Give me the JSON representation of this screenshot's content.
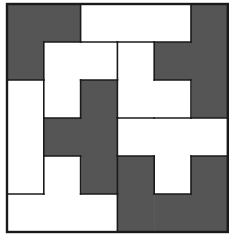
{
  "puzzle": {
    "grid_size": 6,
    "origin": [
      7,
      4
    ],
    "cell": [
      36.8,
      38
    ],
    "colors": {
      "dark": "#555555",
      "light": "#ffffff",
      "stroke": "#1a1a1a"
    },
    "pieces": [
      {
        "name": "piece-dark-top-left",
        "color": "dark",
        "cells": [
          [
            0,
            0
          ],
          [
            0,
            1
          ],
          [
            1,
            0
          ]
        ]
      },
      {
        "name": "piece-light-top-bar",
        "color": "light",
        "cells": [
          [
            0,
            2
          ],
          [
            0,
            3
          ],
          [
            0,
            4
          ]
        ]
      },
      {
        "name": "piece-dark-right",
        "color": "dark",
        "cells": [
          [
            0,
            5
          ],
          [
            1,
            4
          ],
          [
            1,
            5
          ],
          [
            2,
            5
          ]
        ]
      },
      {
        "name": "piece-light-l",
        "color": "light",
        "cells": [
          [
            1,
            1
          ],
          [
            1,
            2
          ],
          [
            2,
            1
          ]
        ]
      },
      {
        "name": "piece-light-center",
        "color": "light",
        "cells": [
          [
            1,
            3
          ],
          [
            2,
            3
          ],
          [
            2,
            4
          ]
        ]
      },
      {
        "name": "piece-light-left-column",
        "color": "light",
        "cells": [
          [
            2,
            0
          ],
          [
            3,
            0
          ],
          [
            4,
            0
          ]
        ]
      },
      {
        "name": "piece-dark-center",
        "color": "dark",
        "cells": [
          [
            2,
            2
          ],
          [
            3,
            1
          ],
          [
            3,
            2
          ],
          [
            4,
            2
          ]
        ]
      },
      {
        "name": "piece-light-t",
        "color": "light",
        "cells": [
          [
            3,
            3
          ],
          [
            3,
            4
          ],
          [
            3,
            5
          ],
          [
            4,
            4
          ]
        ]
      },
      {
        "name": "piece-light-bottom",
        "color": "light",
        "cells": [
          [
            4,
            1
          ],
          [
            5,
            0
          ],
          [
            5,
            1
          ],
          [
            5,
            2
          ]
        ]
      },
      {
        "name": "piece-dark-bottom-right",
        "color": "dark",
        "cells": [
          [
            4,
            3
          ],
          [
            4,
            5
          ],
          [
            5,
            3
          ],
          [
            5,
            4
          ],
          [
            5,
            5
          ]
        ]
      }
    ]
  }
}
